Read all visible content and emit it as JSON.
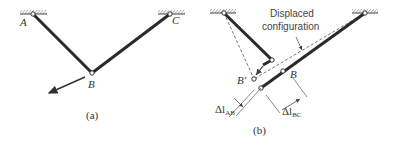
{
  "figure_a": {
    "caption": "(a)",
    "labels": {
      "A": "A",
      "B": "B",
      "C": "C"
    }
  },
  "figure_b": {
    "caption": "(b)",
    "annotation_line1": "Displaced",
    "annotation_line2": "configuration",
    "labels": {
      "B_prime": "B'",
      "B": "B",
      "dl_ab": "Δl",
      "dl_ab_sub": "AB",
      "dl_bc": "Δl",
      "dl_bc_sub": "BC"
    }
  },
  "colors": {
    "bar": "#2a2a2a",
    "line": "#555555",
    "background": "#ffffff"
  }
}
